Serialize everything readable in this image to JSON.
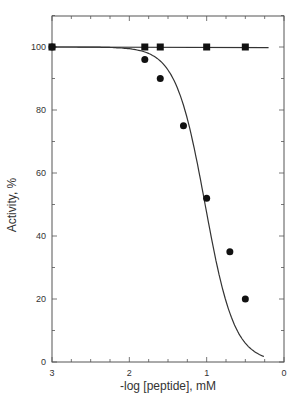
{
  "chart_data": {
    "type": "line",
    "title": "",
    "xlabel": "-log [peptide], mM",
    "ylabel": "Activity, %",
    "xlim": [
      3,
      0
    ],
    "ylim": [
      0,
      110
    ],
    "x_ticks": [
      3,
      2,
      1,
      0
    ],
    "y_ticks": [
      0,
      20,
      40,
      60,
      80,
      100
    ],
    "grid": false,
    "legend": null,
    "series": [
      {
        "name": "squares",
        "marker": "square",
        "x": [
          3.0,
          1.8,
          1.6,
          1.0,
          0.5
        ],
        "y": [
          100,
          100,
          100,
          100,
          100
        ],
        "fit_line": {
          "x": [
            3.0,
            0.2
          ],
          "y": [
            100,
            99.8
          ]
        }
      },
      {
        "name": "circles",
        "marker": "circle",
        "x": [
          3.0,
          1.8,
          1.6,
          1.3,
          1.0,
          0.7,
          0.5
        ],
        "y": [
          100,
          96,
          90,
          75,
          52,
          35,
          20
        ],
        "fit_curve": "sigmoid decreasing to ~9 at x=0.25"
      }
    ]
  }
}
